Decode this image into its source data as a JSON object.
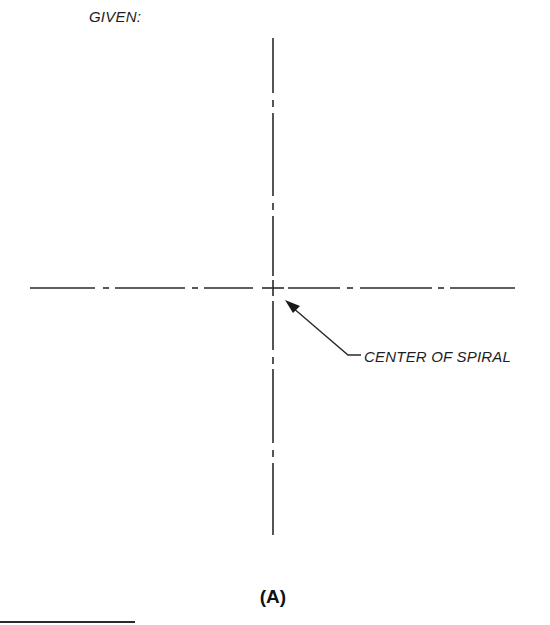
{
  "header": {
    "given_label": "GIVEN:"
  },
  "drawing": {
    "center_point": {
      "x": 273,
      "y": 288
    },
    "vertical_centerline": {
      "x": 273,
      "y_start": 38,
      "y_end": 535
    },
    "horizontal_centerline": {
      "y": 288,
      "x_start": 30,
      "x_end": 515
    },
    "line_style": "center-line (long dash, short dash)",
    "line_color": "#2a2a2a"
  },
  "callout": {
    "text": "CENTER OF SPIRAL",
    "arrow_tip": {
      "x": 286,
      "y": 301
    },
    "leader_bend": {
      "x": 348,
      "y": 355
    },
    "leader_end": {
      "x": 361,
      "y": 355
    }
  },
  "figure": {
    "label": "(A)"
  }
}
